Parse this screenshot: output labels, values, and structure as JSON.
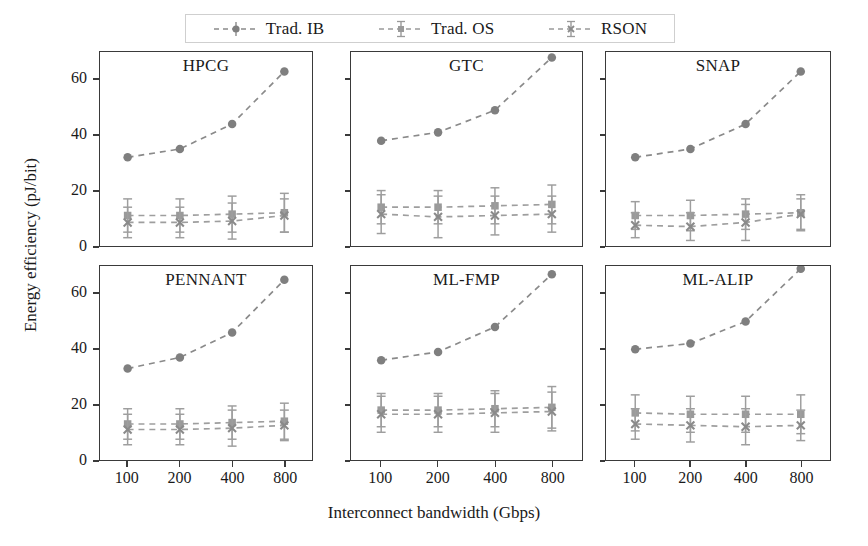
{
  "figure": {
    "xlabel": "Interconnect bandwidth (Gbps)",
    "ylabel": "Energy efficiency (pJ/bit)"
  },
  "legend": {
    "items": [
      {
        "label": "Trad. IB",
        "marker": "circle",
        "color": "#7f7f7f"
      },
      {
        "label": "Trad. OS",
        "marker": "square",
        "color": "#9a9a9a"
      },
      {
        "label": "RSON",
        "marker": "x",
        "color": "#9a9a9a"
      }
    ]
  },
  "axis": {
    "yticks": [
      "0",
      "20",
      "40",
      "60"
    ],
    "xticks": [
      "100",
      "200",
      "400",
      "800"
    ]
  },
  "chart_data": {
    "type": "line",
    "title": "",
    "xlabel": "Interconnect bandwidth (Gbps)",
    "ylabel": "Energy efficiency (pJ/bit)",
    "x": [
      100,
      200,
      400,
      800
    ],
    "xscale": "categorical",
    "ylim": [
      0,
      70
    ],
    "yticks": [
      0,
      20,
      40,
      60
    ],
    "grid": false,
    "legend_position": "top",
    "subplot_layout": [
      2,
      3
    ],
    "subplots": [
      {
        "title": "HPCG",
        "series": [
          {
            "name": "Trad. IB",
            "marker": "circle",
            "values": [
              32,
              35,
              44,
              63
            ]
          },
          {
            "name": "Trad. OS",
            "marker": "square",
            "values": [
              11,
              11,
              11.5,
              12
            ],
            "yerr": [
              6,
              6,
              6.5,
              7
            ]
          },
          {
            "name": "RSON",
            "marker": "x",
            "values": [
              8.5,
              8.5,
              9,
              11
            ],
            "yerr": [
              5.5,
              5.5,
              6.5,
              6
            ]
          }
        ]
      },
      {
        "title": "GTC",
        "series": [
          {
            "name": "Trad. IB",
            "marker": "circle",
            "values": [
              38,
              41,
              49,
              68
            ]
          },
          {
            "name": "Trad. OS",
            "marker": "square",
            "values": [
              14,
              14,
              14.5,
              15
            ],
            "yerr": [
              6,
              6,
              6.5,
              7
            ]
          },
          {
            "name": "RSON",
            "marker": "x",
            "values": [
              11.5,
              10.5,
              11,
              11.5
            ],
            "yerr": [
              7,
              7.5,
              7,
              6.5
            ]
          }
        ]
      },
      {
        "title": "SNAP",
        "series": [
          {
            "name": "Trad. IB",
            "marker": "circle",
            "values": [
              32,
              35,
              44,
              63
            ]
          },
          {
            "name": "Trad. OS",
            "marker": "square",
            "values": [
              11,
              11,
              11.5,
              12
            ],
            "yerr": [
              5,
              5.5,
              5.5,
              6.5
            ]
          },
          {
            "name": "RSON",
            "marker": "x",
            "values": [
              7.5,
              7,
              8.5,
              11.5
            ],
            "yerr": [
              4.5,
              5,
              6.5,
              5.5
            ]
          }
        ]
      },
      {
        "title": "PENNANT",
        "series": [
          {
            "name": "Trad. IB",
            "marker": "circle",
            "values": [
              33,
              37,
              46,
              65
            ]
          },
          {
            "name": "Trad. OS",
            "marker": "square",
            "values": [
              13,
              13,
              13.5,
              14
            ],
            "yerr": [
              5.5,
              5.5,
              6,
              6.5
            ]
          },
          {
            "name": "RSON",
            "marker": "x",
            "values": [
              11,
              11,
              11.5,
              12.5
            ],
            "yerr": [
              5.5,
              5.5,
              6.5,
              5.5
            ]
          }
        ]
      },
      {
        "title": "ML-FMP",
        "series": [
          {
            "name": "Trad. IB",
            "marker": "circle",
            "values": [
              36,
              39,
              48,
              67
            ]
          },
          {
            "name": "Trad. OS",
            "marker": "square",
            "values": [
              18,
              18,
              18.5,
              19
            ],
            "yerr": [
              6,
              6,
              6.5,
              7.5
            ]
          },
          {
            "name": "RSON",
            "marker": "x",
            "values": [
              16.5,
              16.5,
              17,
              17.5
            ],
            "yerr": [
              6.5,
              6.5,
              7,
              7
            ]
          }
        ]
      },
      {
        "title": "ML-ALIP",
        "series": [
          {
            "name": "Trad. IB",
            "marker": "circle",
            "values": [
              40,
              42,
              50,
              69
            ]
          },
          {
            "name": "Trad. OS",
            "marker": "square",
            "values": [
              17,
              16.5,
              16.5,
              16.5
            ],
            "yerr": [
              6.5,
              6.5,
              6.5,
              7
            ]
          },
          {
            "name": "RSON",
            "marker": "x",
            "values": [
              13,
              12.5,
              12,
              12.5
            ],
            "yerr": [
              5.5,
              6,
              6.5,
              5.5
            ]
          }
        ]
      }
    ]
  }
}
